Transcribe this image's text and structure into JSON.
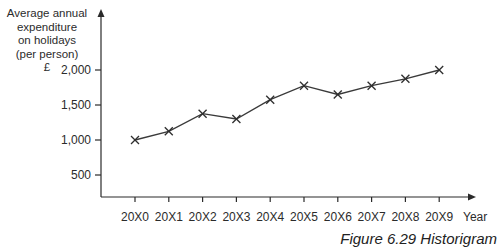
{
  "chart_data": {
    "type": "line",
    "title": "",
    "caption": "Figure 6.29 Historigram",
    "xlabel": "Year",
    "ylabel": [
      "Average annual",
      "expenditure",
      "on holidays",
      "(per person)",
      "£"
    ],
    "categories": [
      "20X0",
      "20X1",
      "20X2",
      "20X3",
      "20X4",
      "20X5",
      "20X6",
      "20X7",
      "20X8",
      "20X9"
    ],
    "series": [
      {
        "name": "Average annual expenditure on holidays (per person)",
        "values": [
          1000,
          1125,
          1375,
          1300,
          1575,
          1775,
          1650,
          1775,
          1875,
          2000
        ],
        "marker": "x"
      }
    ],
    "yticks": [
      500,
      1000,
      1500,
      2000
    ],
    "ytick_labels": [
      "500",
      "1,000",
      "1,500",
      "2,000"
    ],
    "ylim": [
      0,
      2200
    ],
    "grid": false,
    "legend": "none"
  }
}
